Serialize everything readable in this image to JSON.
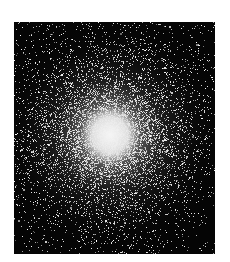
{
  "image": {
    "subject": "globular star cluster",
    "description": "Black-and-white photograph of a dense globular star cluster with a bright, saturated core fading into a sparse field of stars",
    "frame": {
      "x": 14,
      "y": 22,
      "width": 201,
      "height": 232
    },
    "background_color": "#050505",
    "page_color": "#ffffff",
    "core": {
      "cx": 96,
      "cy": 113,
      "radius": 30,
      "color": "#f2f2f2"
    },
    "halo_radius": 120,
    "star_count": 9000,
    "seed": 7
  }
}
